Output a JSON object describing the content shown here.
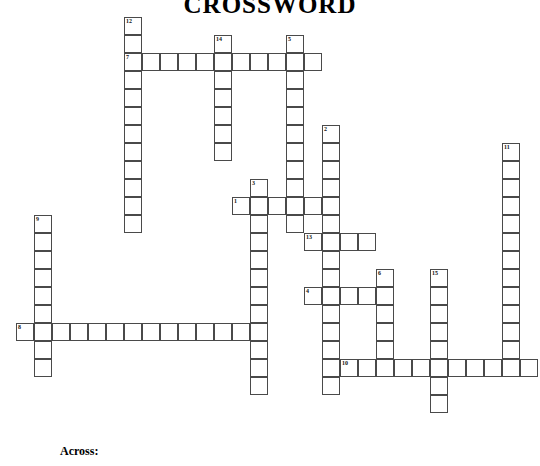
{
  "title": "CROSSWORD",
  "clues": {
    "across_label": "Across:"
  },
  "grid": {
    "cell_size": 18,
    "origin_x": 16,
    "origin_y": 17,
    "border_color": "#4a4a4a",
    "cell_fill": "#ffffff",
    "number_color": "#111111"
  },
  "chart_data": {
    "type": "table",
    "title": "CROSSWORD",
    "entries": [
      {
        "number": 12,
        "direction": "down",
        "col": 6,
        "row": 0,
        "length": 12
      },
      {
        "number": 14,
        "direction": "down",
        "col": 11,
        "row": 1,
        "length": 7
      },
      {
        "number": 5,
        "direction": "down",
        "col": 15,
        "row": 1,
        "length": 11
      },
      {
        "number": 7,
        "direction": "across",
        "col": 6,
        "row": 2,
        "length": 11
      },
      {
        "number": 2,
        "direction": "down",
        "col": 17,
        "row": 6,
        "length": 15
      },
      {
        "number": 11,
        "direction": "down",
        "col": 27,
        "row": 7,
        "length": 13
      },
      {
        "number": 3,
        "direction": "down",
        "col": 13,
        "row": 9,
        "length": 12
      },
      {
        "number": 1,
        "direction": "across",
        "col": 12,
        "row": 10,
        "length": 6
      },
      {
        "number": 9,
        "direction": "down",
        "col": 1,
        "row": 11,
        "length": 9
      },
      {
        "number": 13,
        "direction": "across",
        "col": 16,
        "row": 12,
        "length": 4
      },
      {
        "number": 6,
        "direction": "down",
        "col": 20,
        "row": 14,
        "length": 6
      },
      {
        "number": 15,
        "direction": "down",
        "col": 23,
        "row": 14,
        "length": 8
      },
      {
        "number": 4,
        "direction": "across",
        "col": 16,
        "row": 15,
        "length": 5
      },
      {
        "number": 8,
        "direction": "across",
        "col": 0,
        "row": 17,
        "length": 13
      },
      {
        "number": 10,
        "direction": "across",
        "col": 18,
        "row": 19,
        "length": 11
      }
    ]
  }
}
